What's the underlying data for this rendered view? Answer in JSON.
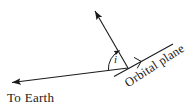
{
  "figure": {
    "background_color": "#ffffff",
    "stroke_color": "#1a1a1a",
    "labels": {
      "to_earth": "To Earth",
      "orbital_plane": "Orbital plane",
      "inclination": "i"
    },
    "elements": {
      "to_earth_arrow": "to-earth-arrow",
      "normal_arrow": "orbit-normal-arrow",
      "orbital_plane_line": "orbital-plane-line",
      "right_angle_marker": "right-angle-marker",
      "angle_arc": "inclination-angle-arc"
    },
    "geometry": {
      "vertex_x": 128,
      "vertex_y": 68,
      "to_earth_tip_x": 8,
      "to_earth_tip_y": 83,
      "normal_tip_x": 92,
      "normal_tip_y": 7,
      "orbital_plane_start_x": 116,
      "orbital_plane_start_y": 75,
      "orbital_plane_end_x": 173,
      "orbital_plane_end_y": 44,
      "inclination_arc_radius": 20,
      "orbital_plane_text_rotation_deg": -33
    }
  }
}
